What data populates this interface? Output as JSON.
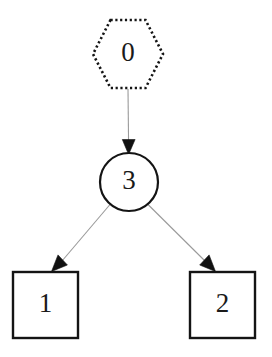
{
  "diagram": {
    "type": "directed-graph",
    "background_color": "#ffffff",
    "node_stroke_color": "#141414",
    "node_fill_color": "#ffffff",
    "edge_color": "#9a9a9a",
    "arrowhead_color": "#111111",
    "label_color": "#1a1a1a",
    "nodes": [
      {
        "id": "0",
        "label": "0",
        "shape": "hexagon",
        "border_style": "dotted",
        "cx": 128,
        "cy": 54,
        "rx": 35,
        "ry": 34
      },
      {
        "id": "3",
        "label": "3",
        "shape": "circle",
        "border_style": "solid",
        "cx": 129,
        "cy": 182,
        "r": 29
      },
      {
        "id": "1",
        "label": "1",
        "shape": "square",
        "border_style": "solid",
        "x": 13,
        "y": 272,
        "width": 65,
        "height": 66
      },
      {
        "id": "2",
        "label": "2",
        "shape": "square",
        "border_style": "solid",
        "x": 190,
        "y": 272,
        "width": 65,
        "height": 66
      }
    ],
    "edges": [
      {
        "from": "0",
        "to": "3",
        "direction": "down",
        "arrowhead": "solid-triangle"
      },
      {
        "from": "3",
        "to": "1",
        "direction": "down-left",
        "arrowhead": "solid-triangle"
      },
      {
        "from": "3",
        "to": "2",
        "direction": "down-right",
        "arrowhead": "solid-triangle"
      }
    ]
  }
}
